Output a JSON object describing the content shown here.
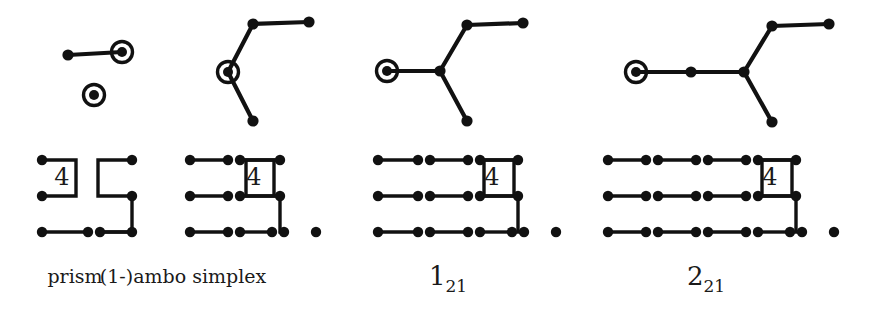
{
  "figure": {
    "background_color": "#ffffff",
    "ink_color": "#111111",
    "columns": [
      {
        "id": "prism",
        "caption": "prism",
        "caption_type": "plain",
        "tree": {
          "description": "Two-component tree: an edge from a plain node to a ringed node, plus one isolated ringed node",
          "nodes": [
            {
              "name": "t1-n1",
              "x": 68,
              "y": 55,
              "ringed": false
            },
            {
              "name": "t1-n2",
              "x": 122,
              "y": 52,
              "ringed": true
            },
            {
              "name": "t1-n3",
              "x": 94,
              "y": 95,
              "ringed": true
            }
          ],
          "edges": [
            [
              "t1-n1",
              "t1-n2"
            ]
          ]
        },
        "coxeter": {
          "description": "Coxeter-Dynkin diagram with a branch marked 4",
          "rows": [
            {
              "name": "row-top",
              "y": 160,
              "nodes": [
                42,
                132
              ],
              "segments": []
            },
            {
              "name": "row-mid",
              "y": 196,
              "nodes": [
                42,
                132
              ],
              "segments": []
            },
            {
              "name": "row-bottom",
              "y": 232,
              "nodes": [
                42,
                88,
                100,
                132
              ],
              "segments": [
                [
                  42,
                  88
                ],
                [
                  100,
                  132
                ]
              ]
            }
          ],
          "branch_label": "4",
          "branch_label_x": 62,
          "branch_label_y": 185
        }
      },
      {
        "id": "ambo-simplex",
        "caption": "(1-)ambo simplex",
        "caption_type": "plain",
        "tree": {
          "description": "Y-shaped tree with ringed node at the left fork",
          "nodes": [
            {
              "name": "t2-n1",
              "x": 228,
              "y": 72,
              "ringed": true
            },
            {
              "name": "t2-n2",
              "x": 253,
              "y": 24,
              "ringed": false
            },
            {
              "name": "t2-n3",
              "x": 309,
              "y": 22,
              "ringed": false
            },
            {
              "name": "t2-n4",
              "x": 253,
              "y": 121,
              "ringed": false
            }
          ],
          "edges": [
            [
              "t2-n1",
              "t2-n2"
            ],
            [
              "t2-n2",
              "t2-n3"
            ],
            [
              "t2-n1",
              "t2-n4"
            ]
          ]
        },
        "coxeter": {
          "rows": [
            {
              "name": "row-top",
              "y": 160,
              "nodes": [
                190,
                228,
                240,
                280
              ],
              "segments": [
                [
                  190,
                  228
                ]
              ]
            },
            {
              "name": "row-mid",
              "y": 196,
              "nodes": [
                190,
                228,
                240,
                280
              ],
              "segments": [
                [
                  190,
                  228
                ]
              ]
            },
            {
              "name": "row-bottom",
              "y": 232,
              "nodes": [
                190,
                228,
                240,
                272,
                284,
                316
              ],
              "segments": [
                [
                  190,
                  228
                ],
                [
                  240,
                  272
                ]
              ]
            }
          ],
          "branch_label": "4",
          "branch_label_x": 254,
          "branch_label_y": 185
        }
      },
      {
        "id": "1-21",
        "caption": "1",
        "caption_subscript": "21",
        "caption_type": "math",
        "tree": {
          "description": "Y-shaped tree, ringed node at left end of the long arm",
          "nodes": [
            {
              "name": "t3-n1",
              "x": 387,
              "y": 71,
              "ringed": true
            },
            {
              "name": "t3-n2",
              "x": 440,
              "y": 71,
              "ringed": false
            },
            {
              "name": "t3-n3",
              "x": 467,
              "y": 25,
              "ringed": false
            },
            {
              "name": "t3-n4",
              "x": 523,
              "y": 23,
              "ringed": false
            },
            {
              "name": "t3-n5",
              "x": 467,
              "y": 121,
              "ringed": false
            }
          ],
          "edges": [
            [
              "t3-n1",
              "t3-n2"
            ],
            [
              "t3-n2",
              "t3-n3"
            ],
            [
              "t3-n3",
              "t3-n4"
            ],
            [
              "t3-n2",
              "t3-n5"
            ]
          ]
        },
        "coxeter": {
          "rows": [
            {
              "name": "row-top",
              "y": 160,
              "nodes": [
                378,
                418,
                430,
                468,
                480,
                518
              ],
              "segments": [
                [
                  378,
                  418
                ],
                [
                  430,
                  468
                ]
              ]
            },
            {
              "name": "row-mid",
              "y": 196,
              "nodes": [
                378,
                418,
                430,
                468,
                480,
                518
              ],
              "segments": [
                [
                  378,
                  418
                ],
                [
                  430,
                  468
                ]
              ]
            },
            {
              "name": "row-bottom",
              "y": 232,
              "nodes": [
                378,
                418,
                430,
                468,
                480,
                512,
                524,
                556
              ],
              "segments": [
                [
                  378,
                  418
                ],
                [
                  430,
                  468
                ],
                [
                  480,
                  512
                ]
              ]
            }
          ],
          "branch_label": "4",
          "branch_label_x": 492,
          "branch_label_y": 185
        }
      },
      {
        "id": "2-21",
        "caption": "2",
        "caption_subscript": "21",
        "caption_type": "math",
        "tree": {
          "description": "Y-shaped tree with an extra node on the long arm, ringed node at far left",
          "nodes": [
            {
              "name": "t4-n1",
              "x": 636,
              "y": 72,
              "ringed": true
            },
            {
              "name": "t4-n2",
              "x": 691,
              "y": 72,
              "ringed": false
            },
            {
              "name": "t4-n3",
              "x": 744,
              "y": 72,
              "ringed": false
            },
            {
              "name": "t4-n4",
              "x": 772,
              "y": 26,
              "ringed": false
            },
            {
              "name": "t4-n5",
              "x": 829,
              "y": 24,
              "ringed": false
            },
            {
              "name": "t4-n6",
              "x": 772,
              "y": 122,
              "ringed": false
            }
          ],
          "edges": [
            [
              "t4-n1",
              "t4-n2"
            ],
            [
              "t4-n2",
              "t4-n3"
            ],
            [
              "t4-n3",
              "t4-n4"
            ],
            [
              "t4-n4",
              "t4-n5"
            ],
            [
              "t4-n3",
              "t4-n6"
            ]
          ]
        },
        "coxeter": {
          "rows": [
            {
              "name": "row-top",
              "y": 160,
              "nodes": [
                608,
                646,
                658,
                696,
                708,
                746,
                758,
                796
              ],
              "segments": [
                [
                  608,
                  646
                ],
                [
                  658,
                  696
                ],
                [
                  708,
                  746
                ]
              ]
            },
            {
              "name": "row-mid",
              "y": 196,
              "nodes": [
                608,
                646,
                658,
                696,
                708,
                746,
                758,
                796
              ],
              "segments": [
                [
                  608,
                  646
                ],
                [
                  658,
                  696
                ],
                [
                  708,
                  746
                ]
              ]
            },
            {
              "name": "row-bottom",
              "y": 232,
              "nodes": [
                608,
                646,
                658,
                696,
                708,
                746,
                758,
                790,
                802,
                834
              ],
              "segments": [
                [
                  608,
                  646
                ],
                [
                  658,
                  696
                ],
                [
                  708,
                  746
                ],
                [
                  758,
                  790
                ]
              ]
            }
          ],
          "branch_label": "4",
          "branch_label_x": 770,
          "branch_label_y": 185
        }
      }
    ],
    "captions": [
      {
        "name": "caption-prism",
        "text": "prism",
        "x": 75,
        "y": 283,
        "type": "plain"
      },
      {
        "name": "caption-ambo-simplex",
        "text": "(1-)ambo simplex",
        "x": 183,
        "y": 283,
        "type": "plain"
      },
      {
        "name": "caption-1-21",
        "text": "1",
        "subscript": "21",
        "x": 448,
        "y": 285,
        "type": "math"
      },
      {
        "name": "caption-2-21",
        "text": "2",
        "subscript": "21",
        "x": 706,
        "y": 285,
        "type": "math"
      }
    ]
  }
}
